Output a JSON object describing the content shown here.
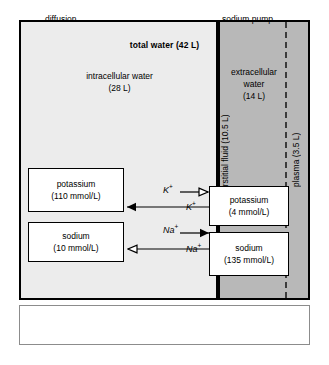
{
  "compartments": {
    "total": {
      "label": "total water (42 L)"
    },
    "intracellular": {
      "name": "intracellular water",
      "volume": "(28 L)"
    },
    "extracellular": {
      "name": "extracellular water",
      "volume": "(14 L)"
    },
    "interstitial": {
      "name": "interstitial fluid",
      "volume": "(10.5 L)"
    },
    "plasma": {
      "name": "plasma",
      "volume": "(3.5 L)"
    }
  },
  "solutes": {
    "potassium_icf": {
      "name": "potassium",
      "concentration": "(110 mmol/L)"
    },
    "sodium_icf": {
      "name": "sodium",
      "concentration": "(10 mmol/L)"
    },
    "potassium_ecf": {
      "name": "potassium",
      "concentration": "(4 mmol/L)"
    },
    "sodium_ecf": {
      "name": "sodium",
      "concentration": "(135 mmol/L)"
    }
  },
  "transport": {
    "k_efflux": {
      "ion": "K",
      "charge": "+",
      "mechanism": "diffusion",
      "direction": "intracellular-to-extracellular"
    },
    "k_influx": {
      "ion": "K",
      "charge": "+",
      "mechanism": "sodium pump",
      "direction": "extracellular-to-intracellular"
    },
    "na_efflux": {
      "ion": "Na",
      "charge": "+",
      "mechanism": "sodium pump",
      "direction": "intracellular-to-extracellular"
    },
    "na_influx": {
      "ion": "Na",
      "charge": "+",
      "mechanism": "diffusion",
      "direction": "extracellular-to-intracellular"
    }
  },
  "legend": {
    "diffusion_label": "diffusion",
    "pump_label": "sodium pump"
  },
  "colors": {
    "intracellular_fill": "#ececec",
    "extracellular_fill": "#b8b8b8",
    "box_fill": "#ffffff",
    "line": "#000000",
    "plasma_divider": "#3c3c3c"
  }
}
